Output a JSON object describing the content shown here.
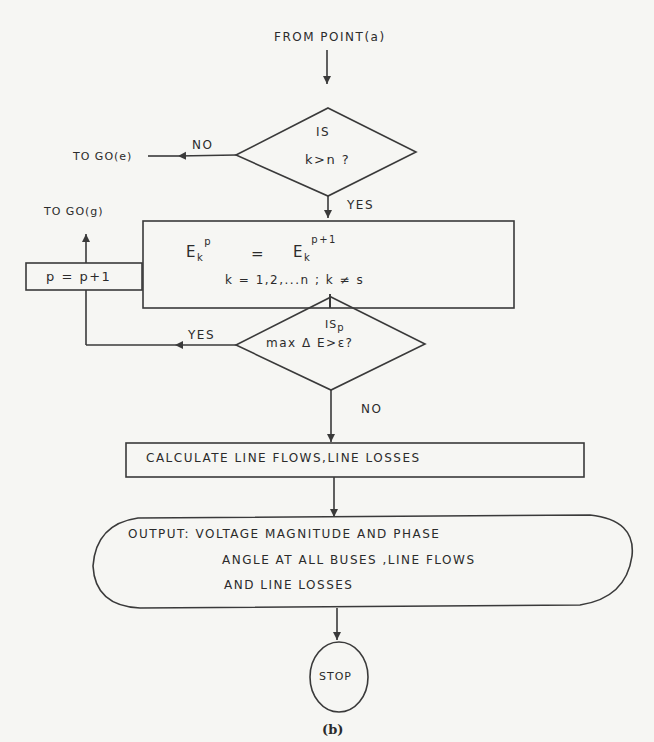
{
  "diagram": {
    "caption": "(b)",
    "start": "FROM POINT(a)",
    "decision1": {
      "line1": "IS",
      "line2": "k>n ?",
      "no_label": "NO",
      "yes_label": "YES",
      "no_target": "TO GO(e)"
    },
    "process1": {
      "lhs": "E",
      "lhs_sub": "k",
      "lhs_sup": "p",
      "eq": "=",
      "rhs": "E",
      "rhs_sub": "k",
      "rhs_sup": "p+1",
      "condition": "k = 1,2,...n ;   k ≠ s"
    },
    "decision2": {
      "line1": "IS",
      "sup": "p",
      "line2_a": "max Δ E",
      "line2_b": ">ε?",
      "yes_label": "YES",
      "no_label": "NO"
    },
    "increment": "p = p+1",
    "goto_g": "TO GO(g)",
    "process2": "CALCULATE LINE FLOWS,LINE LOSSES",
    "output": {
      "line1": "OUTPUT: VOLTAGE   MAGNITUDE AND PHASE",
      "line2": "ANGLE AT ALL BUSES ,LINE FLOWS",
      "line3": "AND LINE LOSSES"
    },
    "stop": "STOP"
  }
}
